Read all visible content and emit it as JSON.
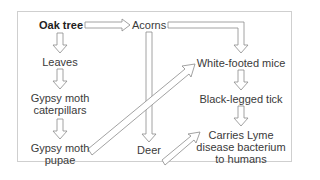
{
  "diagram": {
    "title": "",
    "nodes": {
      "oak_tree": "Oak tree",
      "acorns": "Acorns",
      "leaves": "Leaves",
      "caterpillars_1": "Gypsy moth",
      "caterpillars_2": "caterpillars",
      "pupae_1": "Gypsy moth",
      "pupae_2": "pupae",
      "deer": "Deer",
      "mice": "White-footed mice",
      "tick": "Black-legged tick",
      "lyme_1": "Carries Lyme",
      "lyme_2": "disease bacterium",
      "lyme_3": "to humans"
    },
    "edges": [
      {
        "from": "Oak tree",
        "to": "Acorns"
      },
      {
        "from": "Oak tree",
        "to": "Leaves"
      },
      {
        "from": "Leaves",
        "to": "Gypsy moth caterpillars"
      },
      {
        "from": "Gypsy moth caterpillars",
        "to": "Gypsy moth pupae"
      },
      {
        "from": "Acorns",
        "to": "White-footed mice"
      },
      {
        "from": "Acorns",
        "to": "Deer"
      },
      {
        "from": "Gypsy moth pupae",
        "to": "White-footed mice"
      },
      {
        "from": "White-footed mice",
        "to": "Black-legged tick"
      },
      {
        "from": "Deer",
        "to": "Black-legged tick"
      },
      {
        "from": "Black-legged tick",
        "to": "Carries Lyme disease bacterium to humans"
      }
    ],
    "colors": {
      "arrow_stroke": "#8a8a8a",
      "arrow_fill": "#ffffff",
      "frame": "#cfcfcf",
      "text": "#3a3a3a"
    }
  }
}
